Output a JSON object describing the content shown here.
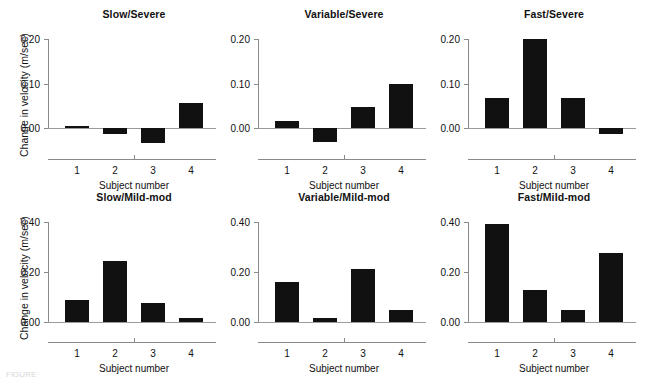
{
  "figure": {
    "y_axis_title": "Change in velocity (m/sec)",
    "x_axis_title": "Subject number",
    "caption_fragment": "FIGURE",
    "bar_color": "#111111",
    "axis_color": "#8a8a8a"
  },
  "chart_data": [
    {
      "type": "bar",
      "title": "Slow/Severe",
      "xlabel": "Subject number",
      "ylabel": "Change in velocity (m/sec)",
      "categories": [
        "1",
        "2",
        "3",
        "4"
      ],
      "values": [
        0.006,
        -0.013,
        -0.033,
        0.058
      ],
      "ylim": [
        -0.055,
        0.225
      ],
      "yticks": [
        0.0,
        0.1,
        0.2
      ],
      "ytick_labels": [
        "0.00",
        "0.10",
        "0.20"
      ],
      "grid": false,
      "legend": "none"
    },
    {
      "type": "bar",
      "title": "Variable/Severe",
      "xlabel": "Subject number",
      "ylabel": "Change in velocity (m/sec)",
      "categories": [
        "1",
        "2",
        "3",
        "4"
      ],
      "values": [
        0.016,
        -0.03,
        0.048,
        0.099
      ],
      "ylim": [
        -0.055,
        0.225
      ],
      "yticks": [
        0.0,
        0.1,
        0.2
      ],
      "ytick_labels": [
        "0.00",
        "0.10",
        "0.20"
      ],
      "grid": false,
      "legend": "none"
    },
    {
      "type": "bar",
      "title": "Fast/Severe",
      "xlabel": "Subject number",
      "ylabel": "Change in velocity (m/sec)",
      "categories": [
        "1",
        "2",
        "3",
        "4"
      ],
      "values": [
        0.068,
        0.2,
        0.068,
        -0.013
      ],
      "ylim": [
        -0.055,
        0.225
      ],
      "yticks": [
        0.0,
        0.1,
        0.2
      ],
      "ytick_labels": [
        "0.00",
        "0.10",
        "0.20"
      ],
      "grid": false,
      "legend": "none"
    },
    {
      "type": "bar",
      "title": "Slow/Mild-mod",
      "xlabel": "Subject number",
      "ylabel": "Change in velocity (m/sec)",
      "categories": [
        "1",
        "2",
        "3",
        "4"
      ],
      "values": [
        0.089,
        0.247,
        0.077,
        0.016
      ],
      "ylim": [
        -0.055,
        0.445
      ],
      "yticks": [
        0.0,
        0.2,
        0.4
      ],
      "ytick_labels": [
        "0.00",
        "0.20",
        "0.40"
      ],
      "grid": false,
      "legend": "none"
    },
    {
      "type": "bar",
      "title": "Variable/Mild-mod",
      "xlabel": "Subject number",
      "ylabel": "Change in velocity (m/sec)",
      "categories": [
        "1",
        "2",
        "3",
        "4"
      ],
      "values": [
        0.16,
        0.018,
        0.214,
        0.051
      ],
      "ylim": [
        -0.055,
        0.445
      ],
      "yticks": [
        0.0,
        0.2,
        0.4
      ],
      "ytick_labels": [
        "0.00",
        "0.20",
        "0.40"
      ],
      "grid": false,
      "legend": "none"
    },
    {
      "type": "bar",
      "title": "Fast/Mild-mod",
      "xlabel": "Subject number",
      "ylabel": "Change in velocity (m/sec)",
      "categories": [
        "1",
        "2",
        "3",
        "4"
      ],
      "values": [
        0.393,
        0.128,
        0.049,
        0.279
      ],
      "ylim": [
        -0.055,
        0.445
      ],
      "yticks": [
        0.0,
        0.2,
        0.4
      ],
      "ytick_labels": [
        "0.00",
        "0.20",
        "0.40"
      ],
      "grid": false,
      "legend": "none"
    }
  ]
}
